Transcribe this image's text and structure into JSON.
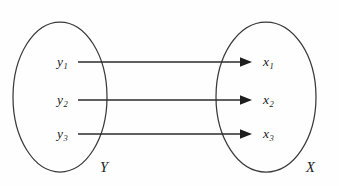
{
  "diagram": {
    "kind": "set-mapping-diagram",
    "background_color": "#fefefe",
    "stroke_color": "#3a3a3a",
    "arrow_color": "#1e1e1e",
    "text_color": "#1c1c1c",
    "domain_set": {
      "label": "Y",
      "label_name": "set-label-y",
      "ellipse": {
        "cx": 60,
        "cy": 97,
        "rx": 47,
        "ry": 75
      },
      "elements": [
        {
          "base": "y",
          "sub": "1",
          "text": "y1"
        },
        {
          "base": "y",
          "sub": "2",
          "text": "y2"
        },
        {
          "base": "y",
          "sub": "3",
          "text": "y3"
        }
      ]
    },
    "codomain_set": {
      "label": "X",
      "label_name": "set-label-x",
      "ellipse": {
        "cx": 266,
        "cy": 97,
        "rx": 50,
        "ry": 75
      },
      "elements": [
        {
          "base": "x",
          "sub": "1",
          "text": "x1"
        },
        {
          "base": "x",
          "sub": "2",
          "text": "x2"
        },
        {
          "base": "x",
          "sub": "3",
          "text": "x3"
        }
      ]
    },
    "arrows": [
      {
        "from": "y1",
        "to": "x1",
        "x1": 78,
        "y1": 62,
        "x2": 252,
        "y2": 62
      },
      {
        "from": "y2",
        "to": "x2",
        "x1": 78,
        "y1": 100,
        "x2": 252,
        "y2": 100
      },
      {
        "from": "y3",
        "to": "x3",
        "x1": 78,
        "y1": 134,
        "x2": 252,
        "y2": 134
      }
    ]
  }
}
